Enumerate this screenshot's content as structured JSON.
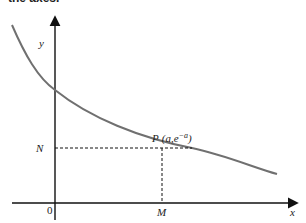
{
  "caption": "the axes.",
  "diagram": {
    "axes": {
      "x_label": "x",
      "y_label": "y",
      "origin_label": "0"
    },
    "curve": {
      "description": "y = e^(-x) decay curve",
      "color": "#707070"
    },
    "point": {
      "label": "P (a,e⁻ᵃ)",
      "label_prefix": "P",
      "label_coords": "(a,e",
      "label_exp": "−a",
      "label_close": ")"
    },
    "markers": {
      "x_marker": "M",
      "y_marker": "N"
    }
  }
}
